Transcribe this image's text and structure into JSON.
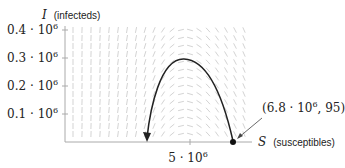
{
  "chart_data": {
    "type": "line",
    "title": "",
    "xlabel": "S (susceptibles)",
    "ylabel": "I (infecteds)",
    "xlabel_var": "S",
    "xlabel_text": "(susceptibles)",
    "ylabel_var": "I",
    "ylabel_text": "(infecteds)",
    "y_ticks": [
      {
        "value": 0.1,
        "label": "0.1 · 10",
        "exp": "6"
      },
      {
        "value": 0.2,
        "label": "0.2 · 10",
        "exp": "6"
      },
      {
        "value": 0.3,
        "label": "0.3 · 10",
        "exp": "6"
      },
      {
        "value": 0.4,
        "label": "0.4 · 10",
        "exp": "6"
      }
    ],
    "x_ticks": [
      {
        "value": 5,
        "label": "5 · 10",
        "exp": "6"
      }
    ],
    "xlim": [
      0,
      8.8
    ],
    "ylim": [
      0,
      0.42
    ],
    "grid": false,
    "background": "slope field (direction field) of the SIR model",
    "series": [
      {
        "name": "trajectory",
        "x": [
          6.8,
          6.5,
          6.0,
          5.5,
          5.0,
          4.7,
          4.2,
          3.8,
          3.6
        ],
        "y": [
          0.0001,
          0.12,
          0.24,
          0.29,
          0.3,
          0.29,
          0.22,
          0.1,
          0.0
        ],
        "direction": "from right to left, arrow at end"
      }
    ],
    "annotations": [
      {
        "text": "(6.8 · 10",
        "exp": "6",
        "tail": ", 95)",
        "point": [
          6.8,
          95
        ]
      }
    ]
  }
}
